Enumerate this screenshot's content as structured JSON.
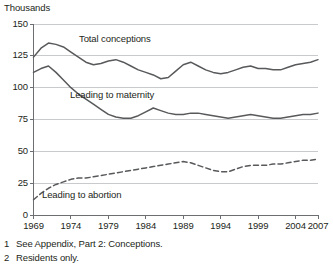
{
  "figure": {
    "unit_label": "Thousands"
  },
  "footnotes": [
    {
      "num": "1",
      "text": "See Appendix, Part 2: Conceptions."
    },
    {
      "num": "2",
      "text": "Residents only."
    }
  ],
  "series_labels": {
    "total": "Total conceptions",
    "maternity": "Leading to maternity",
    "abortion": "Leading to abortion"
  },
  "chart_data": {
    "type": "line",
    "title": "",
    "subtitle": "",
    "xlabel": "",
    "ylabel": "Thousands",
    "xlim": [
      1969,
      2007
    ],
    "ylim": [
      0,
      150
    ],
    "grid": "horizontal",
    "legend": "inline-annotations",
    "y_ticks": [
      0,
      25,
      50,
      75,
      100,
      125,
      150
    ],
    "x_ticks": [
      1969,
      1974,
      1979,
      1984,
      1989,
      1994,
      1999,
      2004,
      2007
    ],
    "x": [
      1969,
      1970,
      1971,
      1972,
      1973,
      1974,
      1975,
      1976,
      1977,
      1978,
      1979,
      1980,
      1981,
      1982,
      1983,
      1984,
      1985,
      1986,
      1987,
      1988,
      1989,
      1990,
      1991,
      1992,
      1993,
      1994,
      1995,
      1996,
      1997,
      1998,
      1999,
      2000,
      2001,
      2002,
      2003,
      2004,
      2005,
      2006,
      2007
    ],
    "series": [
      {
        "name": "Total conceptions",
        "style": "solid",
        "color": "#58595b",
        "values": [
          124,
          131,
          135,
          134,
          132,
          128,
          124,
          120,
          118,
          119,
          121,
          122,
          120,
          117,
          114,
          112,
          110,
          107,
          108,
          113,
          118,
          120,
          117,
          114,
          112,
          111,
          112,
          114,
          116,
          117,
          115,
          115,
          114,
          114,
          116,
          118,
          119,
          120,
          122
        ]
      },
      {
        "name": "Leading to maternity",
        "style": "solid",
        "color": "#58595b",
        "values": [
          112,
          115,
          117,
          112,
          106,
          100,
          95,
          91,
          87,
          83,
          79,
          77,
          76,
          76,
          78,
          81,
          84,
          82,
          80,
          79,
          79,
          80,
          80,
          79,
          78,
          77,
          76,
          77,
          78,
          79,
          78,
          77,
          76,
          76,
          77,
          78,
          79,
          79,
          80
        ]
      },
      {
        "name": "Leading to abortion",
        "style": "dashed",
        "color": "#58595b",
        "values": [
          12,
          17,
          21,
          24,
          26,
          28,
          29,
          29,
          30,
          31,
          32,
          33,
          34,
          35,
          36,
          37,
          38,
          39,
          40,
          41,
          42,
          41,
          39,
          37,
          35,
          34,
          34,
          36,
          38,
          39,
          39,
          39,
          40,
          40,
          41,
          42,
          43,
          43,
          44
        ]
      }
    ]
  }
}
